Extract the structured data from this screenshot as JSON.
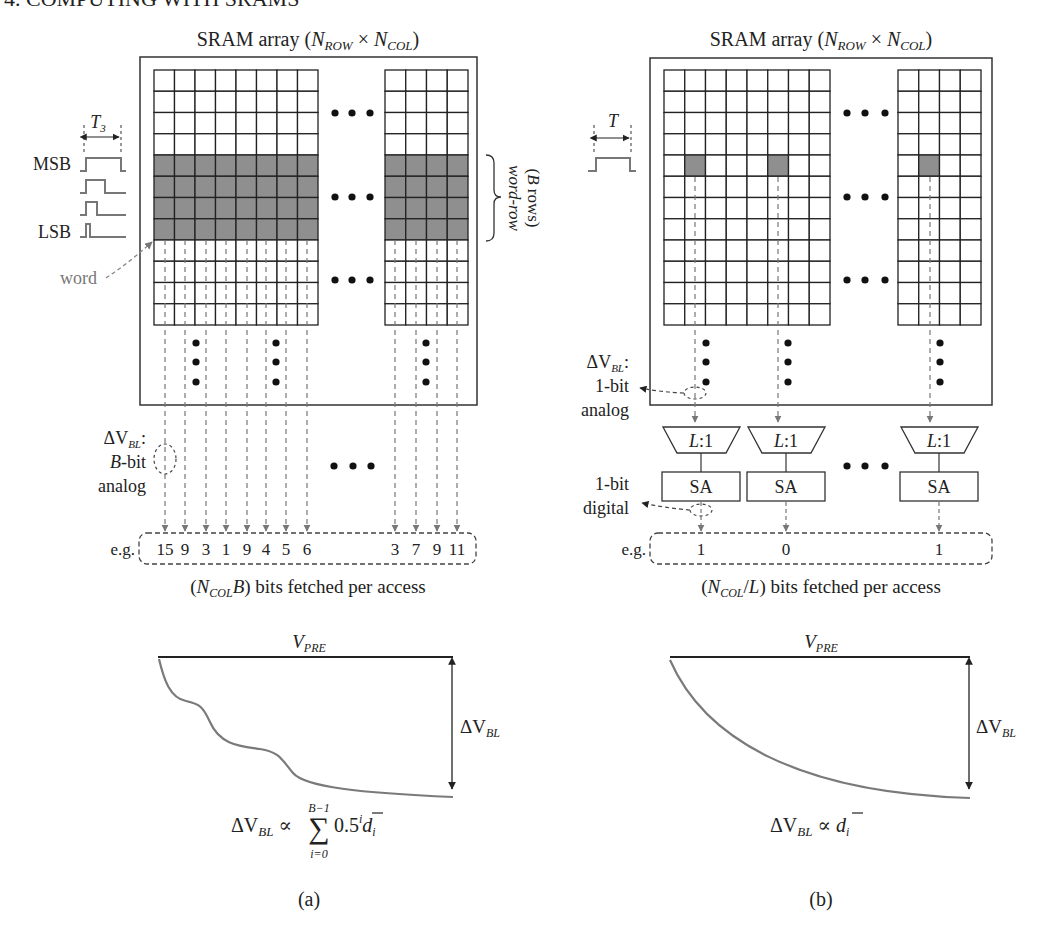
{
  "header": {
    "section_title": "4. COMPUTING WITH SRAMS"
  },
  "panel_a": {
    "caption": "(a)",
    "array_title": {
      "prefix": "SRAM array (",
      "n": "N",
      "row_sub": "ROW",
      "times": " × ",
      "n2": "N",
      "col_sub": "COL",
      "suffix": ")"
    },
    "grid": {
      "left_block": {
        "cols": 8,
        "rows": 12,
        "shaded_rows": [
          4,
          5,
          6,
          7
        ]
      },
      "right_block": {
        "cols": 4,
        "rows": 12,
        "shaded_rows": [
          4,
          5,
          6,
          7
        ]
      }
    },
    "pulse_period_label": {
      "t": "T",
      "sub": "3"
    },
    "msb_label": "MSB",
    "lsb_label": "LSB",
    "word_label": "word",
    "word_row_label": {
      "line1": "word-row",
      "line2_prefix": "(",
      "line2_b": "B",
      "line2_suffix": " rows)"
    },
    "dv_label": {
      "delta": "ΔV",
      "sub": "BL",
      "colon": ":",
      "line2_b": "B",
      "line2_rest": "-bit",
      "line3": "analog"
    },
    "example_prefix": "e.g.",
    "example_values_left": [
      "15",
      "9",
      "3",
      "1",
      "9",
      "4",
      "5",
      "6"
    ],
    "example_values_right": [
      "3",
      "7",
      "9",
      "11"
    ],
    "bits_fetched": {
      "open": "(",
      "n": "N",
      "sub": "COL",
      "b": "B",
      "rest": ") bits fetched per access"
    },
    "waveform": {
      "vpre": {
        "v": "V",
        "sub": "PRE"
      },
      "dv": {
        "delta": "ΔV",
        "sub": "BL"
      },
      "shape": "staircase"
    },
    "formula": {
      "lhs": "ΔV",
      "lhs_sub": "BL",
      "prop": " ∝ ",
      "sum": "∑",
      "upper": "B−1",
      "lower": "i=0",
      "term": "0.5",
      "exp": "i",
      "d": "d",
      "d_sub": "i"
    }
  },
  "panel_b": {
    "caption": "(b)",
    "array_title": {
      "prefix": "SRAM array (",
      "n": "N",
      "row_sub": "ROW",
      "times": " × ",
      "n2": "N",
      "col_sub": "COL",
      "suffix": ")"
    },
    "grid": {
      "left_block": {
        "cols": 8,
        "rows": 12,
        "shaded_cells": [
          [
            4,
            1
          ],
          [
            4,
            5
          ]
        ]
      },
      "right_block": {
        "cols": 4,
        "rows": 12,
        "shaded_cells": [
          [
            4,
            1
          ]
        ]
      }
    },
    "pulse_period_label": {
      "t": "T"
    },
    "dv_label": {
      "delta": "ΔV",
      "sub": "BL",
      "colon": ":",
      "line2": "1-bit",
      "line3": "analog"
    },
    "digital_label": {
      "line1": "1-bit",
      "line2": "digital"
    },
    "mux_label": {
      "l": "L",
      "rest": ":1"
    },
    "sa_label": "SA",
    "example_prefix": "e.g.",
    "example_values": [
      "1",
      "0",
      "1"
    ],
    "bits_fetched": {
      "open": "(",
      "n": "N",
      "sub": "COL",
      "slash": "/",
      "l": "L",
      "rest": ") bits fetched per access"
    },
    "waveform": {
      "vpre": {
        "v": "V",
        "sub": "PRE"
      },
      "dv": {
        "delta": "ΔV",
        "sub": "BL"
      },
      "shape": "exponential"
    },
    "formula": {
      "lhs": "ΔV",
      "lhs_sub": "BL",
      "prop": " ∝ ",
      "d": "d",
      "d_sub": "i"
    }
  },
  "colors": {
    "line": "#222222",
    "shade": "#8f8f8f",
    "dashed": "#777777",
    "curve": "#7a7a7a"
  }
}
